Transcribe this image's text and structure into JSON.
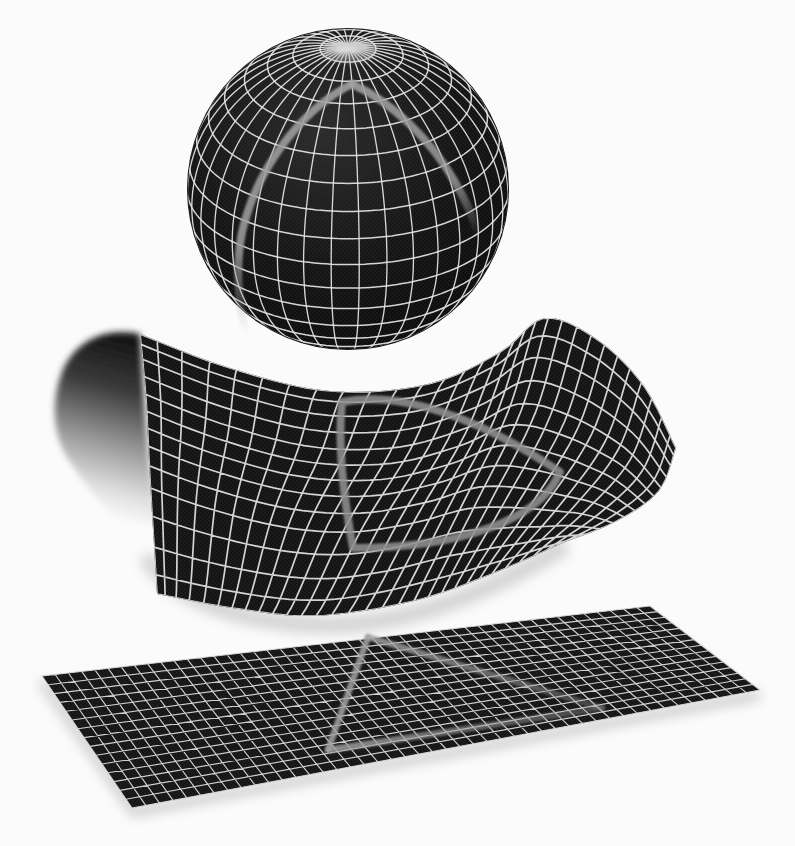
{
  "figure": {
    "alt": "Three dark wireframe surfaces each bearing a gray triangle: a latitude-longitude gridded sphere, a saddle-shaped gridded sheet whose left edge curls over, and a flat gridded plane",
    "background_color": "#fbfbfb",
    "surfaces": [
      {
        "name": "sphere",
        "surface_color": "#131313",
        "grid_color": "#e6e6e6",
        "triangle_color": "#a0a0a0",
        "grid": {
          "meridians": 36,
          "parallels": 17
        }
      },
      {
        "name": "saddle",
        "surface_color": "#141414",
        "grid_color": "#dedede",
        "triangle_color": "#8f8f8f",
        "grid": {
          "columns": 30,
          "rows": 13
        }
      },
      {
        "name": "plane",
        "surface_color": "#161616",
        "grid_color": "#d9d9d9",
        "triangle_color": "#a2a2a2",
        "grid": {
          "columns": 46,
          "rows": 15
        }
      }
    ]
  }
}
